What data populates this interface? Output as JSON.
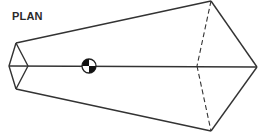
{
  "diagram": {
    "title": "PLAN",
    "stroke_color": "#333333",
    "view": "plan view of kite-shaped body with center of gravity marker",
    "center_of_gravity": {
      "symbol": "cg-marker",
      "x": 89,
      "y": 66
    }
  }
}
